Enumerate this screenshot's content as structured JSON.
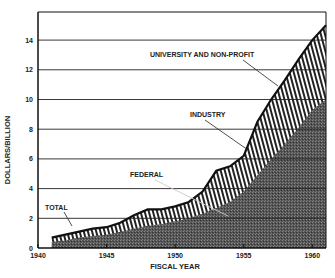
{
  "chart_data": {
    "type": "area",
    "stacked": true,
    "title": "",
    "xlabel": "FISCAL YEAR",
    "ylabel": "DOLLARS/BILLION",
    "xlim": [
      1940,
      1961
    ],
    "ylim": [
      0,
      15
    ],
    "x_ticks": [
      1940,
      1945,
      1950,
      1955,
      1960
    ],
    "y_ticks": [
      0,
      2,
      4,
      6,
      8,
      10,
      12,
      14
    ],
    "grid": true,
    "x": [
      1941,
      1942,
      1943,
      1944,
      1945,
      1946,
      1947,
      1948,
      1949,
      1950,
      1951,
      1952,
      1953,
      1954,
      1955,
      1956,
      1957,
      1958,
      1959,
      1960,
      1961
    ],
    "series": [
      {
        "name": "FEDERAL",
        "fill": "dark stipple",
        "values": [
          0.4,
          0.5,
          0.7,
          0.8,
          0.9,
          1.1,
          1.3,
          1.5,
          1.6,
          1.8,
          2.0,
          2.3,
          2.7,
          3.1,
          3.8,
          4.9,
          6.0,
          7.0,
          8.1,
          9.3,
          10.0
        ]
      },
      {
        "name": "TOTAL (incl. INDUSTRY and UNIVERSITY AND NON-PROFIT)",
        "fill": "vertical hatch",
        "values": [
          0.7,
          0.9,
          1.1,
          1.3,
          1.4,
          1.7,
          2.2,
          2.6,
          2.6,
          2.8,
          3.1,
          3.8,
          5.2,
          5.5,
          6.2,
          8.5,
          10.0,
          11.3,
          12.7,
          14.0,
          15.0
        ]
      }
    ],
    "annotations": [
      "TOTAL",
      "FEDERAL",
      "INDUSTRY",
      "UNIVERSITY AND NON-PROFIT"
    ]
  },
  "labels": {
    "ylabel": "DOLLARS/BILLION",
    "xlabel": "FISCAL YEAR",
    "total": "TOTAL",
    "federal": "FEDERAL",
    "industry": "INDUSTRY",
    "university": "UNIVERSITY AND NON-PROFIT"
  }
}
